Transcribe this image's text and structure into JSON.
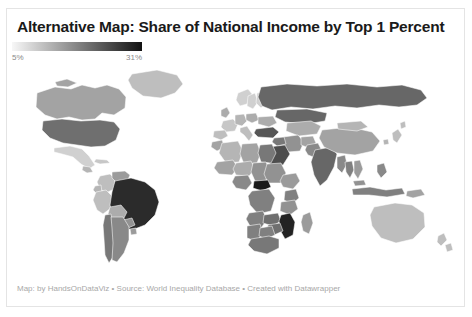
{
  "header": {
    "title": "Alternative Map: Share of National Income by Top 1 Percent"
  },
  "legend": {
    "min_label": "5%",
    "max_label": "31%",
    "min_color": "#f7f7f7",
    "max_color": "#121212",
    "orientation": "horizontal"
  },
  "credit": {
    "text": "Map: by HandsOnDataViz • Source: World Inequality Database • Created with Datawrapper"
  },
  "chart_data": {
    "type": "heatmap",
    "title": "Alternative Map: Share of National Income by Top 1 Percent",
    "subtitle": "",
    "xlabel": "",
    "ylabel": "",
    "unit": "%",
    "value_range": [
      5,
      31
    ],
    "color_scale": {
      "type": "sequential-greyscale",
      "from": "#f7f7f7",
      "to": "#121212",
      "stops": [
        "#f2f2f2",
        "#d6d6d6",
        "#b8b8b8",
        "#9a9a9a",
        "#7d7d7d",
        "#5e5e5e",
        "#3c3c3c",
        "#1c1c1c"
      ]
    },
    "legend_ticks": [
      "5%",
      "31%"
    ],
    "grid": false,
    "legend_position": "top-left",
    "projection": "robinson",
    "regions": [
      {
        "name": "Canada",
        "value": 14
      },
      {
        "name": "United States",
        "value": 20
      },
      {
        "name": "Greenland",
        "value": 11
      },
      {
        "name": "Mexico",
        "value": 9
      },
      {
        "name": "Guatemala",
        "value": 12
      },
      {
        "name": "Cuba",
        "value": 10
      },
      {
        "name": "Brazil",
        "value": 28
      },
      {
        "name": "Colombia",
        "value": 11
      },
      {
        "name": "Venezuela",
        "value": 15
      },
      {
        "name": "Peru",
        "value": 11
      },
      {
        "name": "Bolivia",
        "value": 13
      },
      {
        "name": "Chile",
        "value": 19
      },
      {
        "name": "Argentina",
        "value": 17
      },
      {
        "name": "Uruguay",
        "value": 15
      },
      {
        "name": "Paraguay",
        "value": 16
      },
      {
        "name": "Ecuador",
        "value": 12
      },
      {
        "name": "United Kingdom",
        "value": 13
      },
      {
        "name": "France",
        "value": 10
      },
      {
        "name": "Spain",
        "value": 11
      },
      {
        "name": "Germany",
        "value": 12
      },
      {
        "name": "Italy",
        "value": 11
      },
      {
        "name": "Poland",
        "value": 13
      },
      {
        "name": "Norway",
        "value": 9
      },
      {
        "name": "Sweden",
        "value": 9
      },
      {
        "name": "Finland",
        "value": 9
      },
      {
        "name": "Ukraine",
        "value": 13
      },
      {
        "name": "Russia",
        "value": 21
      },
      {
        "name": "Turkey",
        "value": 23
      },
      {
        "name": "Kazakhstan",
        "value": 13
      },
      {
        "name": "Saudi Arabia",
        "value": 24
      },
      {
        "name": "Iran",
        "value": 16
      },
      {
        "name": "Iraq",
        "value": 19
      },
      {
        "name": "Egypt",
        "value": 19
      },
      {
        "name": "Algeria",
        "value": 12
      },
      {
        "name": "Libya",
        "value": 14
      },
      {
        "name": "Morocco",
        "value": 14
      },
      {
        "name": "Mali",
        "value": 14
      },
      {
        "name": "Niger",
        "value": 13
      },
      {
        "name": "Chad",
        "value": 16
      },
      {
        "name": "Sudan",
        "value": 16
      },
      {
        "name": "Ethiopia",
        "value": 15
      },
      {
        "name": "Nigeria",
        "value": 17
      },
      {
        "name": "Central African Republic",
        "value": 30
      },
      {
        "name": "DR Congo",
        "value": 18
      },
      {
        "name": "Kenya",
        "value": 18
      },
      {
        "name": "Tanzania",
        "value": 16
      },
      {
        "name": "Angola",
        "value": 18
      },
      {
        "name": "Zambia",
        "value": 20
      },
      {
        "name": "Mozambique",
        "value": 29
      },
      {
        "name": "Zimbabwe",
        "value": 20
      },
      {
        "name": "South Africa",
        "value": 19
      },
      {
        "name": "Namibia",
        "value": 18
      },
      {
        "name": "Botswana",
        "value": 18
      },
      {
        "name": "Madagascar",
        "value": 15
      },
      {
        "name": "India",
        "value": 21
      },
      {
        "name": "China",
        "value": 14
      },
      {
        "name": "Mongolia",
        "value": 12
      },
      {
        "name": "Pakistan",
        "value": 17
      },
      {
        "name": "Afghanistan",
        "value": 14
      },
      {
        "name": "Myanmar",
        "value": 17
      },
      {
        "name": "Thailand",
        "value": 18
      },
      {
        "name": "Vietnam",
        "value": 15
      },
      {
        "name": "Indonesia",
        "value": 18
      },
      {
        "name": "Philippines",
        "value": 17
      },
      {
        "name": "Malaysia",
        "value": 16
      },
      {
        "name": "Japan",
        "value": 11
      },
      {
        "name": "South Korea",
        "value": 12
      },
      {
        "name": "Australia",
        "value": 11
      },
      {
        "name": "New Zealand",
        "value": 11
      },
      {
        "name": "Papua New Guinea",
        "value": 14
      }
    ]
  }
}
